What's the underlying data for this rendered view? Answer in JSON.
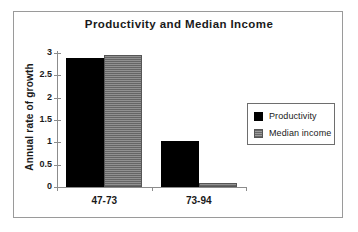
{
  "chart_data": {
    "type": "bar",
    "title": "Productivity and Median Income",
    "xlabel": "",
    "ylabel": "Annual rate of growth",
    "categories": [
      "47-73",
      "73-94"
    ],
    "series": [
      {
        "name": "Productivity",
        "color": "#000000",
        "values": [
          2.88,
          1.02
        ]
      },
      {
        "name": "Median income",
        "color": "#828282",
        "values": [
          2.96,
          0.1
        ]
      }
    ],
    "ylim": [
      0,
      3
    ],
    "yticks": [
      0,
      0.5,
      1,
      1.5,
      2,
      2.5,
      3
    ],
    "ytick_labels": [
      "0",
      "0.5",
      "1",
      "1.5",
      "2",
      "2.5",
      "3"
    ],
    "grid": false,
    "legend_position": "right"
  },
  "legend": {
    "entries": [
      {
        "label": "Productivity"
      },
      {
        "label": "Median income"
      }
    ]
  },
  "frame": {
    "border_color": "#9a9a9a",
    "background": "#ffffff"
  }
}
